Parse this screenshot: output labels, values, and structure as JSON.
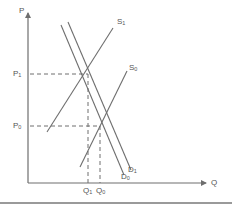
{
  "diagram": {
    "type": "supply-demand",
    "axes": {
      "y_label": "P",
      "x_label": "Q"
    },
    "price_levels": [
      {
        "label": "P",
        "sub": "1",
        "y": 74
      },
      {
        "label": "P",
        "sub": "0",
        "y": 126
      }
    ],
    "quantity_levels": [
      {
        "label": "Q",
        "sub": "1",
        "x": 88
      },
      {
        "label": "Q",
        "sub": "0",
        "x": 100
      }
    ],
    "curves": [
      {
        "name": "S",
        "sub": "1",
        "kind": "supply",
        "x1": 47,
        "y1": 132,
        "x2": 113,
        "y2": 28
      },
      {
        "name": "S",
        "sub": "0",
        "kind": "supply",
        "x1": 80,
        "y1": 167,
        "x2": 127,
        "y2": 71
      },
      {
        "name": "D",
        "sub": "0",
        "kind": "demand",
        "x1": 61,
        "y1": 25,
        "x2": 124,
        "y2": 175
      },
      {
        "name": "D",
        "sub": "1",
        "kind": "demand",
        "x1": 68,
        "y1": 22,
        "x2": 131,
        "y2": 170
      }
    ],
    "colors": {
      "line": "#6e6e6e",
      "dash": "#6e6e6e",
      "text": "#555555"
    }
  }
}
